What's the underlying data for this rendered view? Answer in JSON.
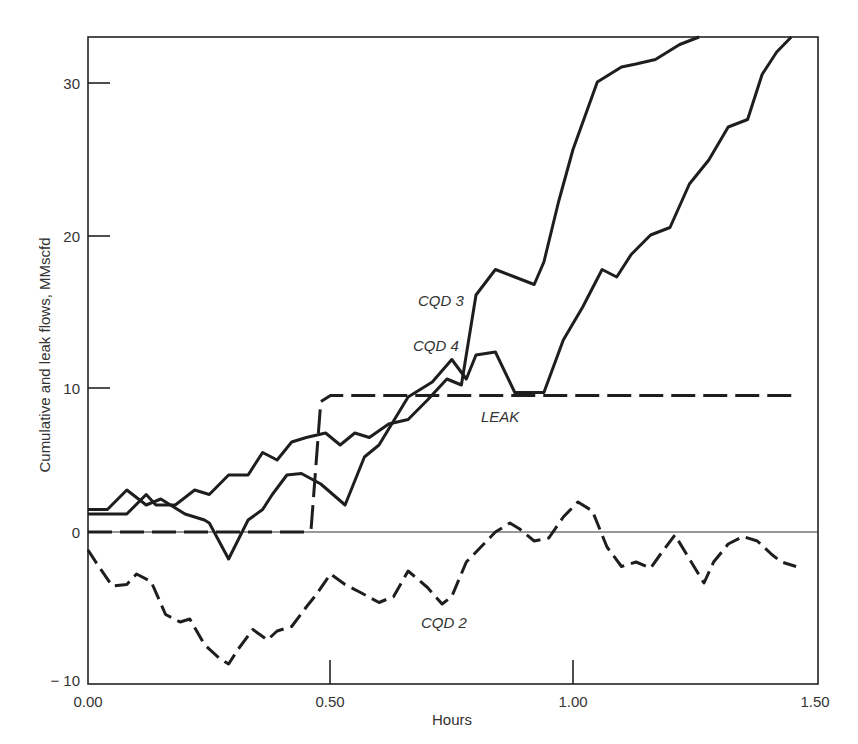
{
  "chart_data": {
    "type": "line",
    "title": "",
    "xlabel": "Hours",
    "ylabel": "Cumulative and leak flows, MMscfd",
    "xlim": [
      0.0,
      1.5
    ],
    "ylim": [
      -10,
      33
    ],
    "x_ticks": [
      "0.00",
      "0.50",
      "1.00",
      "1.50"
    ],
    "y_ticks": [
      "-10",
      "0",
      "10",
      "20",
      "30"
    ],
    "grid": false,
    "zero_line": true,
    "legend": "inline labels",
    "series": [
      {
        "name": "CQD 3",
        "style": "solid",
        "x": [
          0.0,
          0.04,
          0.08,
          0.12,
          0.14,
          0.18,
          0.22,
          0.25,
          0.29,
          0.33,
          0.36,
          0.39,
          0.42,
          0.45,
          0.49,
          0.52,
          0.55,
          0.58,
          0.62,
          0.66,
          0.7,
          0.74,
          0.77,
          0.8,
          0.84,
          0.88,
          0.92,
          0.94,
          0.97,
          1.0,
          1.05,
          1.1,
          1.13,
          1.17,
          1.22,
          1.26
        ],
        "y": [
          1.2,
          1.2,
          1.2,
          2.5,
          1.8,
          1.8,
          2.8,
          2.5,
          3.8,
          3.8,
          5.3,
          4.8,
          6.0,
          6.3,
          6.6,
          5.8,
          6.6,
          6.3,
          7.2,
          7.5,
          8.8,
          10.2,
          9.8,
          15.8,
          17.5,
          17.0,
          16.5,
          18.0,
          22.0,
          25.5,
          30.0,
          31.0,
          31.2,
          31.5,
          32.5,
          33.0
        ]
      },
      {
        "name": "CQD 4",
        "style": "solid",
        "x": [
          0.0,
          0.04,
          0.08,
          0.12,
          0.15,
          0.2,
          0.24,
          0.25,
          0.29,
          0.33,
          0.36,
          0.38,
          0.41,
          0.44,
          0.48,
          0.53,
          0.57,
          0.6,
          0.66,
          0.71,
          0.75,
          0.78,
          0.8,
          0.84,
          0.88,
          0.91,
          0.94,
          0.98,
          1.02,
          1.06,
          1.09,
          1.12,
          1.16,
          1.2,
          1.24,
          1.28,
          1.32,
          1.36,
          1.39,
          1.42,
          1.45
        ],
        "y": [
          1.5,
          1.5,
          2.8,
          1.8,
          2.2,
          1.2,
          0.8,
          0.6,
          -1.8,
          0.8,
          1.5,
          2.5,
          3.8,
          3.9,
          3.2,
          1.8,
          5.0,
          5.8,
          9.0,
          10.0,
          11.5,
          10.2,
          11.8,
          12.0,
          9.3,
          9.3,
          9.3,
          12.8,
          15.0,
          17.5,
          17.0,
          18.5,
          19.8,
          20.3,
          23.2,
          24.8,
          27.0,
          27.5,
          30.5,
          32.0,
          33.0
        ]
      },
      {
        "name": "LEAK",
        "style": "dashed",
        "x": [
          0.0,
          0.1,
          0.2,
          0.3,
          0.4,
          0.45,
          0.46,
          0.48,
          0.5,
          0.6,
          0.7,
          0.8,
          0.9,
          1.0,
          1.1,
          1.2,
          1.3,
          1.4,
          1.46
        ],
        "y": [
          0,
          0,
          0,
          0,
          0,
          0,
          0.2,
          8.7,
          9.1,
          9.1,
          9.1,
          9.1,
          9.1,
          9.1,
          9.1,
          9.1,
          9.1,
          9.1,
          9.1
        ]
      },
      {
        "name": "CQD 2",
        "style": "dashed",
        "x": [
          0.0,
          0.02,
          0.05,
          0.08,
          0.1,
          0.13,
          0.16,
          0.19,
          0.21,
          0.24,
          0.27,
          0.29,
          0.31,
          0.34,
          0.37,
          0.39,
          0.42,
          0.45,
          0.47,
          0.5,
          0.53,
          0.56,
          0.6,
          0.63,
          0.66,
          0.7,
          0.73,
          0.75,
          0.78,
          0.81,
          0.84,
          0.87,
          0.89,
          0.92,
          0.95,
          0.98,
          1.01,
          1.04,
          1.07,
          1.1,
          1.13,
          1.16,
          1.18,
          1.21,
          1.24,
          1.27,
          1.29,
          1.32,
          1.35,
          1.38,
          1.41,
          1.43,
          1.46
        ],
        "y": [
          -1.2,
          -2.2,
          -3.6,
          -3.5,
          -2.8,
          -3.3,
          -5.5,
          -6.0,
          -5.8,
          -7.5,
          -8.4,
          -8.8,
          -7.8,
          -6.5,
          -7.2,
          -6.6,
          -6.3,
          -5.0,
          -4.2,
          -2.8,
          -3.5,
          -4.0,
          -4.7,
          -4.3,
          -2.6,
          -3.7,
          -4.8,
          -4.3,
          -2.0,
          -1.0,
          0.0,
          0.6,
          0.2,
          -0.6,
          -0.4,
          1.0,
          2.0,
          1.4,
          -1.0,
          -2.3,
          -2.0,
          -2.4,
          -1.5,
          -0.2,
          -1.8,
          -3.4,
          -2.0,
          -0.8,
          -0.3,
          -0.6,
          -1.5,
          -2.0,
          -2.3
        ]
      }
    ],
    "annotations": [
      {
        "text": "CQD 3",
        "x": 0.72,
        "y": 14.8
      },
      {
        "text": "CQD 4",
        "x": 0.68,
        "y": 12.3
      },
      {
        "text": "LEAK",
        "x": 0.81,
        "y": 7.6
      },
      {
        "text": "CQD 2",
        "x": 0.79,
        "y": -6.0
      }
    ]
  },
  "labels": {
    "xlabel": "Hours",
    "ylabel": "Cumulative and leak flows, MMscfd",
    "x_ticks": [
      "0.00",
      "0.50",
      "1.00",
      "1.50"
    ],
    "y_ticks": [
      "30",
      "20",
      "10",
      "0",
      "− 10"
    ],
    "cqd3": "CQD 3",
    "cqd4": "CQD 4",
    "leak": "LEAK",
    "cqd2": "CQD 2"
  }
}
